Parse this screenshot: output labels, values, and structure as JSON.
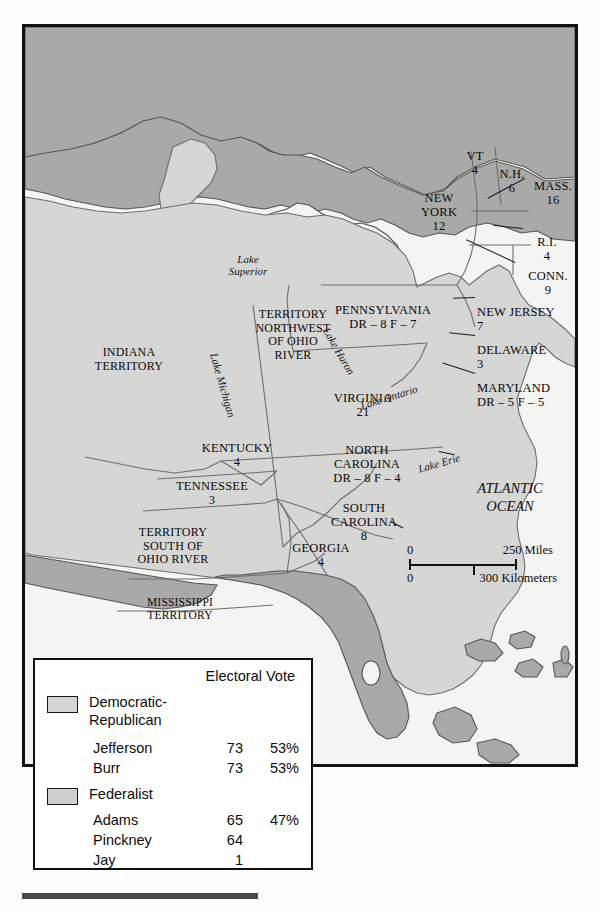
{
  "map": {
    "regions": [
      {
        "name": "INDIANA TERRITORY",
        "label": "INDIANA\nTERRITORY",
        "votes": ""
      },
      {
        "name": "TERRITORY NORTHWEST OF OHIO RIVER",
        "label": "TERRITORY\nNORTHWEST\nOF OHIO\nRIVER",
        "votes": ""
      },
      {
        "name": "NEW YORK",
        "label": "NEW\nYORK",
        "votes": "12"
      },
      {
        "name": "PENNSYLVANIA",
        "label": "PENNSYLVANIA",
        "votes": "DR – 8   F – 7"
      },
      {
        "name": "VIRGINIA",
        "label": "VIRGINIA",
        "votes": "21"
      },
      {
        "name": "KENTUCKY",
        "label": "KENTUCKY",
        "votes": "4"
      },
      {
        "name": "TENNESSEE",
        "label": "TENNESSEE",
        "votes": "3"
      },
      {
        "name": "TERRITORY SOUTH OF OHIO RIVER",
        "label": "TERRITORY\nSOUTH OF\nOHIO RIVER",
        "votes": ""
      },
      {
        "name": "MISSISSIPPI TERRITORY",
        "label": "MISSISSIPPI\nTERRITORY",
        "votes": ""
      },
      {
        "name": "GEORGIA",
        "label": "GEORGIA",
        "votes": "4"
      },
      {
        "name": "NORTH CAROLINA",
        "label": "NORTH\nCAROLINA",
        "votes": "DR – 8   F – 4"
      },
      {
        "name": "SOUTH CAROLINA",
        "label": "SOUTH\nCAROLINA",
        "votes": "8"
      },
      {
        "name": "VERMONT",
        "label": "VT",
        "votes": "4"
      },
      {
        "name": "NEW HAMPSHIRE",
        "label": "N.H.",
        "votes": "6"
      },
      {
        "name": "MASSACHUSETTS",
        "label": "MASS.",
        "votes": "16"
      },
      {
        "name": "RHODE ISLAND",
        "label": "R.I.",
        "votes": "4"
      },
      {
        "name": "CONNECTICUT",
        "label": "CONN.",
        "votes": "9"
      },
      {
        "name": "NEW JERSEY",
        "label": "NEW JERSEY",
        "votes": "7"
      },
      {
        "name": "DELAWARE",
        "label": "DELAWARE",
        "votes": "3"
      },
      {
        "name": "MARYLAND",
        "label": "MARYLAND",
        "votes": "DR – 5   F – 5"
      }
    ],
    "water": {
      "lake_superior": "Lake\nSuperior",
      "lake_michigan": "Lake Michigan",
      "lake_huron": "Lake Huron",
      "lake_erie": "Lake Erie",
      "lake_ontario": "Lake Ontario",
      "ocean": "ATLANTIC\nOCEAN"
    },
    "colors": {
      "state_fill": "#d6d6d4",
      "foreign_fill": "#a9a9a7",
      "water_fill": "#f4f4f2",
      "border": "#6d6d6d",
      "frame": "#121212"
    }
  },
  "scale": {
    "miles_zero": "0",
    "miles_max": "250 Miles",
    "km_zero": "0",
    "km_max": "300 Kilometers"
  },
  "legend": {
    "header": "Electoral Vote",
    "parties": [
      {
        "name": "Democratic-\nRepublican",
        "swatch": "#d6d6d4",
        "candidates": [
          {
            "name": "Jefferson",
            "votes": "73",
            "percent": "53%"
          },
          {
            "name": "Burr",
            "votes": "73",
            "percent": "53%"
          }
        ]
      },
      {
        "name": "Federalist",
        "swatch": "#cfcfcd",
        "candidates": [
          {
            "name": "Adams",
            "votes": "65",
            "percent": "47%"
          },
          {
            "name": "Pinckney",
            "votes": "64",
            "percent": ""
          },
          {
            "name": "Jay",
            "votes": "1",
            "percent": ""
          }
        ]
      }
    ]
  }
}
